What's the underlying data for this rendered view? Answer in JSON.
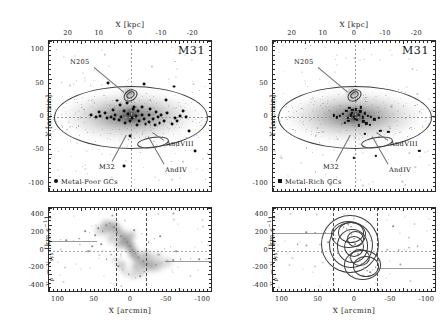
{
  "figure": {
    "object": "M31",
    "panels": [
      "metal-poor",
      "metal-rich"
    ]
  },
  "chart_data": [
    {
      "id": "top-left-sky",
      "type": "scatter",
      "title": "M31",
      "subtitle": "Metal-Poor GCs spatial distribution on M31 starcount map",
      "xlabel_top": "X [kpc]",
      "xlabel_bottom": "",
      "ylabel": "Y [arcmin]",
      "xticks_top": [
        20,
        10,
        0,
        -10,
        -20
      ],
      "xticks_top_labels": [
        "20",
        "10",
        "0",
        "-10",
        "-20"
      ],
      "yticks": [
        100,
        50,
        0,
        -50,
        -100
      ],
      "ytick_labels": [
        "100",
        "50",
        "0",
        "-50",
        "-100"
      ],
      "xlim_kpc": [
        26,
        -26
      ],
      "ylim_arcmin": [
        -112,
        112
      ],
      "grid": false,
      "legend": "Metal-Poor GCs",
      "legend_marker": "filled-circle",
      "legend_position": "lower-left",
      "annotations": [
        "N205",
        "M32",
        "AndVIII",
        "AndIV"
      ],
      "overlays": [
        {
          "name": "M31 disk ellipse",
          "kind": "ellipse",
          "cx_arcmin": 0,
          "cy_arcmin": 0,
          "a_arcmin": 95,
          "b_arcmin": 32
        },
        {
          "name": "N205 ellipse",
          "kind": "ellipse",
          "cx_arcmin": -2,
          "cy_arcmin": 40,
          "a_arcmin": 7,
          "b_arcmin": 4
        },
        {
          "name": "AndVIII ellipse",
          "kind": "ellipse",
          "cx_arcmin": -21,
          "cy_arcmin": -17,
          "a_arcmin": 17,
          "b_arcmin": 5
        }
      ],
      "points": [
        [
          7.0,
          49
        ],
        [
          -14.0,
          44
        ],
        [
          -4.5,
          48
        ],
        [
          -11.5,
          24
        ],
        [
          4.2,
          23
        ],
        [
          1.0,
          19
        ],
        [
          3.2,
          16
        ],
        [
          -1.2,
          14
        ],
        [
          -4.0,
          13
        ],
        [
          -6.5,
          11
        ],
        [
          5.5,
          9
        ],
        [
          2.0,
          8
        ],
        [
          -2.5,
          7
        ],
        [
          -8.5,
          6
        ],
        [
          -12.0,
          5
        ],
        [
          8.0,
          4
        ],
        [
          0.5,
          3
        ],
        [
          -3.8,
          2
        ],
        [
          -6.0,
          1
        ],
        [
          -10.0,
          1
        ],
        [
          11.0,
          -1
        ],
        [
          6.0,
          -2
        ],
        [
          2.8,
          -2
        ],
        [
          -0.8,
          -3
        ],
        [
          -4.5,
          -4
        ],
        [
          -7.5,
          -4
        ],
        [
          -14.5,
          -3
        ],
        [
          -18.0,
          -2
        ],
        [
          9.5,
          0
        ],
        [
          4.8,
          1
        ],
        [
          -2.0,
          0
        ],
        [
          -9.0,
          -1
        ],
        [
          -16.0,
          0
        ],
        [
          3.5,
          -6
        ],
        [
          0.0,
          -7
        ],
        [
          -3.0,
          -8
        ],
        [
          -6.2,
          -9
        ],
        [
          -9.5,
          -10
        ],
        [
          -5.0,
          -12
        ],
        [
          -8.0,
          -13
        ],
        [
          -2.2,
          -14
        ],
        [
          -11.0,
          -7
        ],
        [
          1.5,
          -11
        ],
        [
          -13.5,
          -12
        ],
        [
          0.0,
          -30
        ],
        [
          2.0,
          -75
        ],
        [
          -21.0,
          -52
        ],
        [
          -19.0,
          -22
        ],
        [
          5.0,
          -5
        ],
        [
          -1.0,
          11
        ],
        [
          7.5,
          -3
        ],
        [
          -17.0,
          7
        ],
        [
          12.5,
          2
        ],
        [
          -15.0,
          -8
        ],
        [
          10.0,
          6
        ]
      ]
    },
    {
      "id": "top-right-sky",
      "type": "scatter",
      "title": "M31",
      "subtitle": "Metal-Rich GCs spatial distribution on M31 starcount map",
      "xlabel_top": "X [kpc]",
      "ylabel": "Y [arcmin]",
      "xticks_top_labels": [
        "20",
        "10",
        "0",
        "-10",
        "-20"
      ],
      "ytick_labels": [
        "100",
        "50",
        "0",
        "-50",
        "-100"
      ],
      "xlim_kpc": [
        26,
        -26
      ],
      "ylim_arcmin": [
        -112,
        112
      ],
      "grid": false,
      "legend": "Metal-Rich GCs",
      "legend_marker": "filled-square",
      "legend_position": "lower-left",
      "annotations": [
        "N205",
        "M32",
        "AndVIII",
        "AndIV"
      ],
      "overlays": [
        {
          "name": "M31 disk ellipse",
          "kind": "ellipse",
          "cx_arcmin": 0,
          "cy_arcmin": 0,
          "a_arcmin": 95,
          "b_arcmin": 32
        },
        {
          "name": "N205 ellipse",
          "kind": "ellipse",
          "cx_arcmin": -2,
          "cy_arcmin": 40,
          "a_arcmin": 7,
          "b_arcmin": 4
        },
        {
          "name": "AndVIII ellipse",
          "kind": "ellipse",
          "cx_arcmin": -21,
          "cy_arcmin": -17,
          "a_arcmin": 17,
          "b_arcmin": 5
        }
      ],
      "points": [
        [
          1.5,
          12
        ],
        [
          -0.5,
          10
        ],
        [
          2.5,
          8
        ],
        [
          -2.0,
          7
        ],
        [
          0.8,
          5
        ],
        [
          -3.5,
          4
        ],
        [
          3.5,
          3
        ],
        [
          -1.5,
          2
        ],
        [
          1.0,
          1
        ],
        [
          -4.5,
          0
        ],
        [
          4.5,
          0
        ],
        [
          0.0,
          -1
        ],
        [
          -2.8,
          -2
        ],
        [
          2.0,
          -3
        ],
        [
          -0.2,
          -4
        ],
        [
          -5.5,
          -1
        ],
        [
          5.5,
          -2
        ],
        [
          -1.0,
          -6
        ],
        [
          1.8,
          -7
        ],
        [
          -3.0,
          -8
        ],
        [
          -6.5,
          -5
        ],
        [
          6.5,
          1
        ],
        [
          -8.0,
          -3
        ],
        [
          0.5,
          9
        ],
        [
          -2.2,
          13
        ],
        [
          3.0,
          -10
        ],
        [
          -4.0,
          -11
        ],
        [
          -1.5,
          -14
        ],
        [
          -5.0,
          -13
        ],
        [
          -21.0,
          -52
        ],
        [
          -8.5,
          -22
        ],
        [
          -3.5,
          -27
        ],
        [
          -11.0,
          -24
        ],
        [
          -7.0,
          -60
        ],
        [
          0.0,
          -63
        ]
      ]
    },
    {
      "id": "bottom-left-velocity",
      "type": "scatter",
      "subtitle": "Metal-Poor GC velocities vs position, density shaded",
      "xlabel": "X [arcmin]",
      "ylabel": "v_p - v_sys [km s^-1]",
      "xticks": [
        100,
        50,
        0,
        -50,
        -100
      ],
      "xtick_labels": [
        "100",
        "50",
        "0",
        "-50",
        "-100"
      ],
      "yticks": [
        400,
        200,
        0,
        -200,
        -400
      ],
      "ytick_labels": [
        "400",
        "200",
        "0",
        "-200",
        "-400"
      ],
      "xlim": [
        112,
        -112
      ],
      "ylim": [
        -470,
        470
      ],
      "grid": false,
      "vertical_dashed_lines": [
        20,
        -20
      ],
      "rotation_curve_plateau": [
        110,
        -110
      ],
      "zero_line": 0,
      "points": [
        [
          62,
          205
        ],
        [
          56,
          190
        ],
        [
          48,
          160
        ],
        [
          44,
          240
        ],
        [
          38,
          210
        ],
        [
          33,
          275
        ],
        [
          28,
          300
        ],
        [
          22,
          250
        ],
        [
          18,
          195
        ],
        [
          12,
          150
        ],
        [
          8,
          120
        ],
        [
          4,
          80
        ],
        [
          0,
          40
        ],
        [
          -3,
          0
        ],
        [
          -8,
          -45
        ],
        [
          -12,
          -90
        ],
        [
          -18,
          -130
        ],
        [
          -24,
          -160
        ],
        [
          -30,
          -185
        ],
        [
          -36,
          -170
        ],
        [
          -44,
          -150
        ],
        [
          -52,
          -130
        ],
        [
          -60,
          -120
        ],
        [
          -70,
          -110
        ],
        [
          -84,
          -105
        ],
        [
          70,
          120
        ],
        [
          78,
          100
        ],
        [
          88,
          105
        ],
        [
          96,
          110
        ],
        [
          -96,
          -110
        ],
        [
          -20,
          -250
        ],
        [
          -14,
          -300
        ],
        [
          -8,
          -320
        ],
        [
          2,
          -280
        ],
        [
          10,
          -230
        ],
        [
          16,
          -190
        ],
        [
          -40,
          -60
        ],
        [
          -48,
          10
        ],
        [
          -56,
          30
        ],
        [
          -64,
          -20
        ],
        [
          26,
          -60
        ],
        [
          32,
          -110
        ],
        [
          40,
          60
        ],
        [
          52,
          40
        ],
        [
          58,
          -20
        ],
        [
          -26,
          80
        ],
        [
          -34,
          120
        ],
        [
          -42,
          150
        ],
        [
          -16,
          180
        ],
        [
          -6,
          220
        ]
      ]
    },
    {
      "id": "bottom-right-velocity",
      "type": "scatter",
      "subtitle": "Metal-Rich GC velocities vs position, contoured",
      "xlabel": "X [arcmin]",
      "ylabel": "v_p - v_sys [km s^-1]",
      "xticks": [
        100,
        50,
        0,
        -50,
        -100
      ],
      "xtick_labels": [
        "100",
        "50",
        "0",
        "-50",
        "-100"
      ],
      "yticks": [
        400,
        200,
        0,
        -200,
        -400
      ],
      "ytick_labels": [
        "400",
        "200",
        "0",
        "-200",
        "-400"
      ],
      "xlim": [
        112,
        -112
      ],
      "ylim": [
        -470,
        470
      ],
      "grid": false,
      "vertical_dashed_lines": [
        30,
        -30
      ],
      "rotation_curve_plateau": [
        195,
        -195
      ],
      "zero_line": 0,
      "points": [
        [
          10,
          230
        ],
        [
          6,
          200
        ],
        [
          3,
          170
        ],
        [
          0,
          120
        ],
        [
          -2,
          60
        ],
        [
          -4,
          10
        ],
        [
          -6,
          -50
        ],
        [
          -8,
          -110
        ],
        [
          -11,
          -160
        ],
        [
          -14,
          -210
        ],
        [
          -18,
          -240
        ],
        [
          -22,
          -255
        ],
        [
          -26,
          -230
        ],
        [
          -30,
          -200
        ],
        [
          4,
          260
        ],
        [
          8,
          280
        ],
        [
          14,
          250
        ],
        [
          2,
          -300
        ],
        [
          -1,
          -320
        ],
        [
          -12,
          -290
        ],
        [
          30,
          200
        ],
        [
          40,
          190
        ],
        [
          54,
          190
        ],
        [
          66,
          195
        ],
        [
          -54,
          265
        ],
        [
          -70,
          0
        ],
        [
          -76,
          20
        ],
        [
          -62,
          -10
        ],
        [
          -46,
          0
        ],
        [
          22,
          -40
        ],
        [
          -34,
          -120
        ],
        [
          -24,
          100
        ],
        [
          -16,
          150
        ],
        [
          26,
          120
        ],
        [
          36,
          80
        ],
        [
          -88,
          40
        ],
        [
          78,
          60
        ],
        [
          44,
          -30
        ]
      ]
    }
  ],
  "labels": {
    "x_kpc": "X [kpc]",
    "y_arcmin": "Y [arcmin]",
    "x_arcmin": "X [arcmin]",
    "v_axis_pre": "v",
    "v_axis_sub1": "p",
    "v_axis_minus": " − v",
    "v_axis_sub2": "sys",
    "v_axis_unit": " [km s",
    "v_axis_exp": "−1",
    "v_axis_close": "]",
    "title_m31": "M31",
    "legend_poor": "Metal-Poor GCs",
    "legend_rich": "Metal-Rich GCs",
    "n205": "N205",
    "m32": "M32",
    "andviii": "AndVIII",
    "andiv": "AndIV"
  },
  "colors": {
    "axis": "#2a2a2a",
    "marker": "#0d0d0d",
    "faint": "#9b9b9b",
    "grid_dash": "#9a9a9a",
    "background": "#ffffff",
    "density": "#4a4a4a"
  }
}
